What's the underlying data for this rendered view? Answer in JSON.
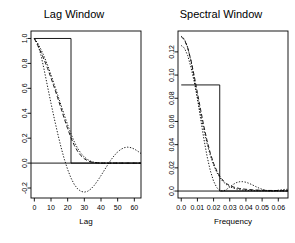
{
  "figure": {
    "width": 295,
    "height": 243,
    "background": "#ffffff",
    "foreground": "#000000"
  },
  "chart_data": [
    {
      "type": "line",
      "id": "lag-window",
      "title": "Lag Window",
      "xlabel": "Lag",
      "ylabel": "",
      "xlim": [
        -2,
        64
      ],
      "ylim": [
        -0.28,
        1.06
      ],
      "xticks": [
        0,
        10,
        20,
        30,
        40,
        50,
        60
      ],
      "xticklabels": [
        "0",
        "10",
        "20",
        "30",
        "40",
        "50",
        "60"
      ],
      "yticks": [
        -0.2,
        0.0,
        0.2,
        0.4,
        0.6,
        0.8,
        1.0
      ],
      "yticklabels": [
        "-0.2",
        "0.0",
        "0.2",
        "0.4",
        "0.6",
        "0.8",
        "1.0"
      ],
      "grid": false,
      "legend": "none",
      "zero_line": 0.0,
      "series": [
        {
          "name": "rectangular",
          "style": "solid",
          "x": [
            0,
            22,
            22,
            64
          ],
          "y": [
            1.0,
            1.0,
            0.0,
            0.0
          ]
        },
        {
          "name": "bartlett",
          "style": "dashed",
          "x": [
            0,
            2,
            4,
            6,
            8,
            10,
            12,
            14,
            16,
            18,
            20,
            22,
            24,
            26,
            28,
            30,
            32,
            34,
            36,
            40,
            45,
            50,
            55,
            60,
            64
          ],
          "y": [
            1.0,
            0.945,
            0.888,
            0.826,
            0.758,
            0.684,
            0.606,
            0.524,
            0.44,
            0.356,
            0.276,
            0.203,
            0.142,
            0.094,
            0.059,
            0.035,
            0.019,
            0.009,
            0.004,
            0.0,
            0.0,
            0.0,
            0.0,
            0.0,
            0.0
          ]
        },
        {
          "name": "parzen",
          "style": "dotdash",
          "x": [
            0,
            2,
            4,
            6,
            8,
            10,
            12,
            14,
            16,
            18,
            20,
            22,
            24,
            26,
            28,
            30,
            32,
            34,
            36,
            40,
            45,
            50,
            55,
            60,
            64
          ],
          "y": [
            1.0,
            0.962,
            0.912,
            0.852,
            0.784,
            0.709,
            0.63,
            0.548,
            0.466,
            0.385,
            0.307,
            0.234,
            0.17,
            0.118,
            0.078,
            0.048,
            0.028,
            0.014,
            0.006,
            0.0,
            0.0,
            0.0,
            0.0,
            0.0,
            0.0
          ]
        },
        {
          "name": "daniell",
          "style": "dotted",
          "x": [
            0,
            2,
            4,
            6,
            8,
            10,
            12,
            14,
            16,
            18,
            20,
            22,
            24,
            26,
            28,
            30,
            32,
            34,
            36,
            38,
            40,
            42,
            44,
            46,
            48,
            50,
            52,
            54,
            56,
            58,
            60,
            62,
            64
          ],
          "y": [
            1.0,
            0.958,
            0.865,
            0.742,
            0.61,
            0.48,
            0.356,
            0.238,
            0.128,
            0.031,
            -0.052,
            -0.12,
            -0.172,
            -0.207,
            -0.227,
            -0.233,
            -0.226,
            -0.207,
            -0.178,
            -0.141,
            -0.1,
            -0.057,
            -0.014,
            0.026,
            0.061,
            0.09,
            0.111,
            0.124,
            0.128,
            0.124,
            0.113,
            0.096,
            0.077
          ]
        }
      ]
    },
    {
      "type": "line",
      "id": "spectral-window",
      "title": "Spectral Window",
      "xlabel": "Frequency",
      "ylabel": "",
      "xlim": [
        -0.002,
        0.066
      ],
      "ylim": [
        -0.006,
        0.138
      ],
      "xticks": [
        0.0,
        0.01,
        0.02,
        0.03,
        0.04,
        0.05,
        0.06
      ],
      "xticklabels": [
        "0.0",
        "0.01",
        "0.02",
        "0.03",
        "0.04",
        "0.05",
        "0.06"
      ],
      "yticks": [
        0.0,
        0.02,
        0.04,
        0.06,
        0.08,
        0.1,
        0.12
      ],
      "yticklabels": [
        "0.0",
        "0.02",
        "0.04",
        "0.06",
        "0.08",
        "0.10",
        "0.12"
      ],
      "grid": false,
      "legend": "none",
      "zero_line": 0.0,
      "series": [
        {
          "name": "rectangular",
          "style": "solid",
          "x": [
            0.0,
            0.0238,
            0.0238,
            0.066
          ],
          "y": [
            0.0915,
            0.0915,
            0.0,
            0.0
          ]
        },
        {
          "name": "bartlett",
          "style": "dashed",
          "x": [
            0.0,
            0.002,
            0.004,
            0.006,
            0.008,
            0.01,
            0.012,
            0.014,
            0.016,
            0.018,
            0.02,
            0.022,
            0.024,
            0.026,
            0.028,
            0.03,
            0.032,
            0.034,
            0.036,
            0.038,
            0.04,
            0.042,
            0.044,
            0.046,
            0.048,
            0.05,
            0.052,
            0.054,
            0.056,
            0.058,
            0.06,
            0.062,
            0.064,
            0.066
          ],
          "y": [
            0.133,
            0.1305,
            0.1235,
            0.1128,
            0.0995,
            0.0848,
            0.07,
            0.0558,
            0.0432,
            0.0325,
            0.0239,
            0.0173,
            0.0124,
            0.0089,
            0.0064,
            0.0047,
            0.0036,
            0.0028,
            0.0022,
            0.0018,
            0.0015,
            0.0013,
            0.0011,
            0.0009,
            0.0008,
            0.0007,
            0.0006,
            0.0005,
            0.0005,
            0.0004,
            0.0004,
            0.0003,
            0.0003,
            0.0003
          ]
        },
        {
          "name": "parzen",
          "style": "dotted",
          "x": [
            0.0,
            0.002,
            0.004,
            0.006,
            0.008,
            0.01,
            0.012,
            0.014,
            0.016,
            0.018,
            0.02,
            0.022,
            0.024,
            0.026,
            0.028,
            0.03,
            0.032,
            0.034,
            0.036,
            0.038,
            0.04,
            0.042,
            0.044,
            0.046,
            0.048,
            0.05,
            0.052,
            0.054,
            0.056,
            0.058,
            0.06,
            0.062,
            0.064,
            0.066
          ],
          "y": [
            0.1255,
            0.1232,
            0.1168,
            0.1068,
            0.0943,
            0.0803,
            0.0661,
            0.0527,
            0.0407,
            0.0306,
            0.0224,
            0.016,
            0.0113,
            0.0079,
            0.0055,
            0.0038,
            0.0026,
            0.0018,
            0.0013,
            0.0009,
            0.0007,
            0.0005,
            0.0004,
            0.0003,
            0.0002,
            0.0002,
            0.0002,
            0.0001,
            0.0001,
            0.0001,
            0.0001,
            0.0001,
            0.0001,
            0.0001
          ]
        },
        {
          "name": "daniell",
          "style": "dotdash",
          "x": [
            0.0,
            0.002,
            0.004,
            0.006,
            0.008,
            0.01,
            0.012,
            0.014,
            0.016,
            0.018,
            0.02,
            0.022,
            0.024,
            0.026,
            0.028,
            0.03,
            0.032,
            0.034,
            0.036,
            0.038,
            0.04,
            0.042,
            0.044,
            0.046,
            0.048,
            0.05,
            0.052,
            0.054,
            0.056,
            0.058,
            0.06,
            0.062,
            0.064,
            0.066
          ],
          "y": [
            0.1335,
            0.131,
            0.1238,
            0.1122,
            0.0972,
            0.08,
            0.0621,
            0.0449,
            0.0297,
            0.0174,
            0.0085,
            0.0029,
            0.0003,
            0.0,
            0.0014,
            0.0035,
            0.0056,
            0.0072,
            0.008,
            0.0081,
            0.0076,
            0.0066,
            0.0053,
            0.0039,
            0.0026,
            0.0015,
            0.0007,
            0.0002,
            0.0001,
            0.0003,
            0.0007,
            0.0011,
            0.0014,
            0.0015
          ]
        }
      ]
    }
  ]
}
